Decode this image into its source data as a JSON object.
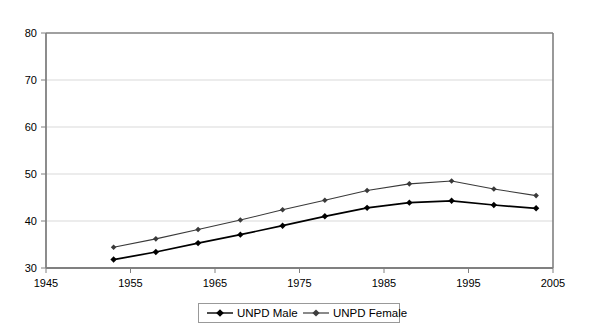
{
  "chart_data": {
    "type": "line",
    "title": "",
    "subtitle": "",
    "xlabel": "",
    "ylabel": "",
    "xlim": [
      1945,
      2005
    ],
    "ylim": [
      30,
      80
    ],
    "xticks": [
      "1945",
      "1955",
      "1965",
      "1975",
      "1985",
      "1995",
      "2005"
    ],
    "yticks": [
      "30",
      "40",
      "50",
      "60",
      "70",
      "80"
    ],
    "grid": "horizontal",
    "legend_position": "bottom",
    "x": [
      1953,
      1958,
      1963,
      1968,
      1973,
      1978,
      1983,
      1988,
      1993,
      1998,
      2003
    ],
    "series": [
      {
        "name": "UNPD Male",
        "color": "#000000",
        "marker": "diamond",
        "values": [
          31.8,
          33.4,
          35.3,
          37.1,
          39.0,
          41.0,
          42.8,
          43.9,
          44.3,
          43.4,
          42.7
        ]
      },
      {
        "name": "UNPD Female",
        "color": "#3a3a3a",
        "marker": "diamond",
        "values": [
          34.4,
          36.2,
          38.2,
          40.2,
          42.4,
          44.4,
          46.5,
          47.9,
          48.5,
          46.8,
          45.4
        ]
      }
    ]
  },
  "axes": {
    "y_tick_labels": [
      "80",
      "70",
      "60",
      "50",
      "40",
      "30"
    ],
    "x_tick_labels": [
      "1945",
      "1955",
      "1965",
      "1975",
      "1985",
      "1995",
      "2005"
    ]
  },
  "legend": {
    "items": [
      {
        "label": "UNPD Male"
      },
      {
        "label": "UNPD Female"
      }
    ]
  },
  "colors": {
    "plot_border": "#808080",
    "gridline": "#d9d9d9",
    "series_male": "#000000",
    "series_female": "#3d3d3d",
    "background": "#ffffff",
    "legend_border": "#999999"
  }
}
